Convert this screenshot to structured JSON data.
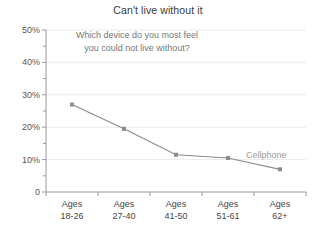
{
  "chart_data": {
    "type": "line",
    "title": "Can't live without it",
    "annotation": [
      "Which device do you most feel",
      "you could not live without?"
    ],
    "categories": [
      "Ages 18-26",
      "Ages 27-40",
      "Ages 41-50",
      "Ages 51-61",
      "Ages 62+"
    ],
    "category_lines": [
      [
        "Ages",
        "18-26"
      ],
      [
        "Ages",
        "27-40"
      ],
      [
        "Ages",
        "41-50"
      ],
      [
        "Ages",
        "51-61"
      ],
      [
        "Ages",
        "62+"
      ]
    ],
    "series": [
      {
        "name": "Cellphone",
        "values": [
          27,
          19.5,
          11.5,
          10.5,
          7
        ],
        "color": "#8c8c8c",
        "marker": "square"
      }
    ],
    "xlabel": "",
    "ylabel": "",
    "ylim": [
      0,
      50
    ],
    "ytick_values": [
      0,
      10,
      20,
      30,
      40,
      50
    ],
    "ytick_labels": [
      "0",
      "10%",
      "20%",
      "30%",
      "40%",
      "50%"
    ],
    "yminor_values": [
      5,
      15,
      25,
      35,
      45
    ],
    "grid": true,
    "grid_color": "#ebebeb",
    "axis_color": "#9a9a9a",
    "legend_position": "inline-right"
  },
  "colors": {
    "background": "#ffffff",
    "title_text": "#3a3a3a",
    "annotation_text": "#777777",
    "tick_text": "#555555",
    "series_label": "#9a9a9a"
  }
}
